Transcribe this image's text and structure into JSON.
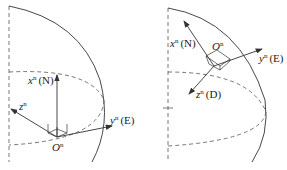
{
  "panels": [
    {
      "id": "left",
      "origin_label": "O",
      "origin_sup": "n",
      "axes": [
        {
          "name": "x",
          "sup": "n",
          "dir": "(N)"
        },
        {
          "name": "y",
          "sup": "n",
          "dir": "(E)"
        },
        {
          "name": "z",
          "sup": "n",
          "dir": ""
        }
      ]
    },
    {
      "id": "right",
      "origin_label": "O",
      "origin_sup": "n",
      "axes": [
        {
          "name": "x",
          "sup": "n",
          "dir": "(N)"
        },
        {
          "name": "y",
          "sup": "n",
          "dir": "(E)"
        },
        {
          "name": "z",
          "sup": "n",
          "dir": "(D)"
        }
      ]
    }
  ],
  "colors": {
    "line": "#333333",
    "dashed": "#555555"
  }
}
